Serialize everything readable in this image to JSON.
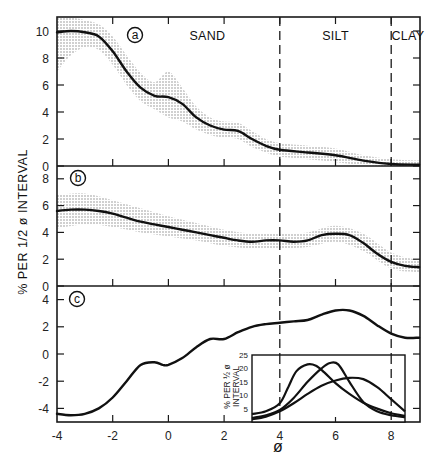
{
  "chart_data": {
    "type": "line",
    "title": "",
    "xlabel": "ø",
    "ylabel": "% PER 1/2 ø INTERVAL",
    "xlim": [
      -4,
      9
    ],
    "x_ticks": [
      -4,
      -2,
      0,
      2,
      4,
      6,
      8
    ],
    "x_tick_labels": [
      "-4",
      "-2",
      "0",
      "2",
      "4",
      "6",
      "8"
    ],
    "grid": false,
    "vertical_dashed_lines": [
      4,
      8
    ],
    "zones": [
      {
        "label": "SAND",
        "x": 1.4
      },
      {
        "label": "SILT",
        "x": 6.0
      },
      {
        "label": "CLAY",
        "x": 8.6
      }
    ],
    "panels": [
      {
        "label": "a",
        "ylim": [
          0,
          11
        ],
        "y_ticks": [
          0,
          2,
          4,
          6,
          8,
          10
        ],
        "y_tick_labels": [
          "0",
          "2",
          "4",
          "6",
          "8",
          "10"
        ],
        "series": [
          {
            "name": "mean",
            "x": [
              -4,
              -3.5,
              -3,
              -2.5,
              -2,
              -1.5,
              -1,
              -0.5,
              0,
              0.5,
              1,
              1.5,
              2,
              2.5,
              3,
              3.5,
              4,
              5,
              6,
              7,
              8,
              9
            ],
            "values": [
              9.9,
              10.0,
              9.9,
              9.6,
              8.5,
              7.0,
              5.8,
              5.2,
              5.1,
              4.6,
              3.6,
              3.0,
              2.7,
              2.6,
              2.0,
              1.5,
              1.2,
              1.0,
              0.8,
              0.4,
              0.15,
              0.1
            ]
          }
        ],
        "band": {
          "x": [
            -4,
            -3.5,
            -3,
            -2.5,
            -2,
            -1.5,
            -1,
            -0.5,
            0,
            0.5,
            1,
            1.5,
            2,
            2.5,
            3,
            3.5,
            4,
            5,
            6,
            7,
            8,
            9
          ],
          "upper": [
            11.0,
            11.0,
            10.8,
            10.5,
            9.6,
            8.2,
            6.9,
            6.2,
            7.0,
            5.8,
            4.4,
            3.6,
            3.3,
            3.2,
            2.6,
            2.0,
            1.7,
            1.5,
            1.3,
            0.8,
            0.5,
            0.4
          ],
          "lower": [
            7.0,
            8.2,
            8.8,
            8.6,
            7.5,
            6.0,
            4.8,
            4.2,
            3.6,
            3.3,
            2.7,
            2.3,
            2.1,
            2.0,
            1.4,
            1.0,
            0.7,
            0.5,
            0.3,
            0.05,
            0.0,
            0.0
          ]
        }
      },
      {
        "label": "b",
        "ylim": [
          0,
          9
        ],
        "y_ticks": [
          0,
          2,
          4,
          6,
          8
        ],
        "y_tick_labels": [
          "0",
          "2",
          "4",
          "6",
          "8"
        ],
        "series": [
          {
            "name": "mean",
            "x": [
              -4,
              -3.5,
              -3,
              -2.5,
              -2,
              -1.5,
              -1,
              -0.5,
              0,
              0.5,
              1,
              1.5,
              2,
              2.5,
              3,
              3.5,
              4,
              4.5,
              5,
              5.5,
              6,
              6.5,
              7,
              7.5,
              8,
              8.5,
              9
            ],
            "values": [
              5.6,
              5.7,
              5.7,
              5.6,
              5.4,
              5.1,
              4.8,
              4.6,
              4.4,
              4.2,
              4.0,
              3.8,
              3.6,
              3.4,
              3.3,
              3.4,
              3.4,
              3.3,
              3.4,
              3.8,
              3.9,
              3.8,
              3.2,
              2.4,
              1.8,
              1.5,
              1.4
            ]
          }
        ],
        "band": {
          "x": [
            -4,
            -3,
            -2,
            -1,
            0,
            1,
            2,
            3,
            4,
            5,
            6,
            7,
            8,
            9
          ],
          "upper": [
            6.8,
            6.9,
            6.4,
            5.8,
            5.2,
            4.7,
            4.2,
            3.9,
            3.9,
            4.0,
            4.5,
            3.9,
            2.5,
            1.9
          ],
          "lower": [
            4.3,
            4.6,
            4.4,
            4.0,
            3.7,
            3.4,
            3.0,
            2.8,
            2.8,
            2.9,
            3.3,
            2.6,
            1.3,
            1.0
          ]
        }
      },
      {
        "label": "c",
        "ylim": [
          -5,
          5
        ],
        "y_ticks": [
          -4,
          -2,
          0,
          2,
          4
        ],
        "y_tick_labels": [
          "-4",
          "-2",
          "0",
          "2",
          "4"
        ],
        "series": [
          {
            "name": "difference",
            "x": [
              -4,
              -3.5,
              -3,
              -2.5,
              -2,
              -1.5,
              -1,
              -0.5,
              -0.2,
              0,
              0.5,
              1,
              1.5,
              2,
              2.5,
              3,
              3.5,
              4,
              4.5,
              5,
              5.5,
              6,
              6.5,
              7,
              7.5,
              8,
              8.5,
              9
            ],
            "values": [
              -4.4,
              -4.5,
              -4.4,
              -4.0,
              -3.2,
              -2.0,
              -0.8,
              -0.6,
              -0.8,
              -0.8,
              -0.3,
              0.5,
              1.1,
              1.1,
              1.6,
              2.0,
              2.2,
              2.3,
              2.4,
              2.5,
              2.9,
              3.2,
              3.2,
              2.8,
              2.1,
              1.5,
              1.2,
              1.2
            ]
          }
        ]
      }
    ],
    "inset": {
      "type": "line",
      "ylabel": "% PER 1/2 ø INTERVAL",
      "ylim": [
        0,
        25
      ],
      "y_ticks": [
        5,
        10,
        15,
        20,
        25
      ],
      "y_tick_labels": [
        "5",
        "10",
        "15",
        "20",
        "25"
      ],
      "xlim": [
        3,
        8.5
      ],
      "series": [
        {
          "name": "curve-1",
          "x": [
            3,
            3.5,
            4,
            4.3,
            4.6,
            5,
            5.3,
            5.6,
            6,
            6.5,
            7,
            7.5,
            8,
            8.5
          ],
          "values": [
            3.0,
            4.0,
            7.0,
            13.0,
            19.0,
            21.5,
            21.0,
            18.5,
            14.5,
            10.5,
            7.2,
            5.0,
            3.3,
            2.3
          ]
        },
        {
          "name": "curve-2",
          "x": [
            3,
            3.5,
            4,
            4.5,
            5,
            5.5,
            5.8,
            6.1,
            6.5,
            7,
            7.5,
            8,
            8.5
          ],
          "values": [
            1.5,
            2.5,
            4.5,
            9.0,
            15.0,
            20.0,
            22.0,
            21.5,
            15.0,
            7.5,
            4.0,
            2.5,
            1.8
          ]
        },
        {
          "name": "curve-3",
          "x": [
            3,
            3.5,
            4,
            4.5,
            5,
            5.5,
            6,
            6.5,
            7,
            7.5,
            8,
            8.5
          ],
          "values": [
            1.0,
            2.0,
            4.0,
            7.0,
            10.5,
            13.5,
            15.5,
            16.5,
            16.0,
            13.0,
            8.5,
            4.0
          ]
        }
      ]
    },
    "panel_labels": [
      "a",
      "b",
      "c"
    ]
  }
}
